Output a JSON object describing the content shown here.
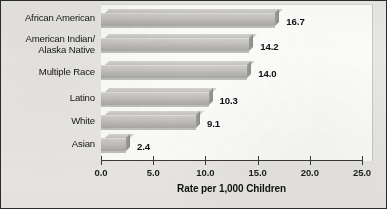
{
  "chart_data": {
    "type": "bar",
    "orientation": "horizontal",
    "title": "",
    "xlabel": "Rate per 1,000 Children",
    "ylabel": "",
    "xlim": [
      0.0,
      25.0
    ],
    "xticks": [
      "0.0",
      "5.0",
      "10.0",
      "15.0",
      "20.0",
      "25.0"
    ],
    "xtick_values": [
      0,
      5,
      10,
      15,
      20,
      25
    ],
    "grid": false,
    "legend": "none",
    "categories": [
      "African American",
      "American Indian/\nAlaska Native",
      "Multiple Race",
      "Latino",
      "White",
      "Asian"
    ],
    "values": [
      16.7,
      14.2,
      14.0,
      10.3,
      9.1,
      2.4
    ],
    "value_labels": [
      "16.7",
      "14.2",
      "14.0",
      "10.3",
      "9.1",
      "2.4"
    ],
    "bar_color": "#c3c2bf",
    "bar_shadow_color": "#8e8d8a",
    "bar_highlight_color": "#d5d4d0",
    "axis_color": "#3a3a3a",
    "plot_background": "#fbfbfa",
    "figure_background": "#e8e7e3",
    "border_color": "#2b2b2b"
  }
}
